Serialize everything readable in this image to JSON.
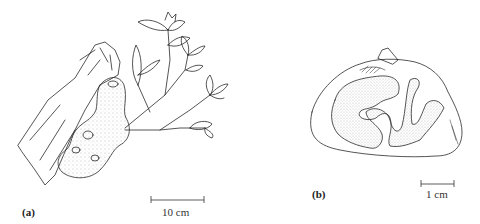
{
  "figure": {
    "panels": [
      {
        "id": "a",
        "label": "(a)",
        "subject": "plant-with-tuber-on-branch",
        "scale_bar": {
          "text": "10 cm"
        }
      },
      {
        "id": "b",
        "label": "(b)",
        "subject": "tuber-cross-section",
        "scale_bar": {
          "text": "1 cm"
        }
      }
    ],
    "colors": {
      "ink": "#2a2a2a",
      "stipple": "#8a8a8a",
      "background": "#ffffff"
    }
  }
}
